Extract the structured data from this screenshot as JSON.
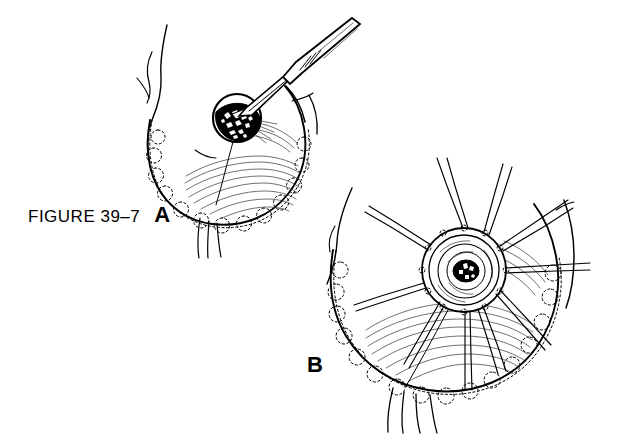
{
  "figure": {
    "caption_number": "FIGURE 39–7",
    "panel_a_label": "A",
    "panel_b_label": "B",
    "background_color": "#ffffff",
    "ink_color": "#000000"
  },
  "panels": [
    {
      "id": "a",
      "label": "A",
      "description": "Breast with scalpel incising pigmented nipple-areola lesion",
      "elements": [
        "breast-contour",
        "surgical-drape-scalloped-edge",
        "pigmented-areola-lesion",
        "scalpel-instrument",
        "skin-fold-lines",
        "breast-shading-hatching"
      ]
    },
    {
      "id": "b",
      "label": "B",
      "description": "Areola with radial traction sutures placed circumferentially",
      "elements": [
        "breast-contour",
        "surgical-drape-scalloped-edge",
        "areola-concentric-rings",
        "nipple-center",
        "radial-traction-sutures",
        "skin-fold-lines",
        "breast-shading-hatching"
      ],
      "suture_count": 10
    }
  ]
}
